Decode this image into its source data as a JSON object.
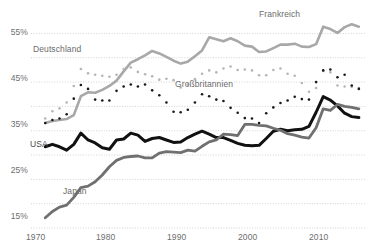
{
  "chart_data": {
    "type": "line",
    "title": "",
    "subtitle": "",
    "xlabel": "",
    "ylabel": "",
    "xlim": [
      1968,
      2015
    ],
    "ylim": [
      15,
      59
    ],
    "yticks": [
      15,
      25,
      35,
      45,
      55
    ],
    "ytick_labels": [
      "15%",
      "25%",
      "35%",
      "45%",
      "55%"
    ],
    "minor_gridlines": [
      20,
      30,
      40,
      50
    ],
    "xticks": [
      1970,
      1980,
      1990,
      2000,
      2010
    ],
    "xtick_labels": [
      "1970",
      "1980",
      "1990",
      "2000",
      "2010"
    ],
    "grid": "horizontal-dotted",
    "legend": "inline-annotations",
    "colors": {
      "frankreich": "#a8a8a8",
      "deutschland": "#b5b5b5",
      "grossbritannien": "#1a1a1a",
      "usa": "#111111",
      "japan": "#707070",
      "gridline": "#c8c8c8",
      "axis_text": "#6e6e6e",
      "background": "#ffffff"
    },
    "x": [
      1970,
      1971,
      1972,
      1973,
      1974,
      1975,
      1976,
      1977,
      1978,
      1979,
      1980,
      1981,
      1982,
      1983,
      1984,
      1985,
      1986,
      1987,
      1988,
      1989,
      1990,
      1991,
      1992,
      1993,
      1994,
      1995,
      1996,
      1997,
      1998,
      1999,
      2000,
      2001,
      2002,
      2003,
      2004,
      2005,
      2006,
      2007,
      2008,
      2009,
      2010,
      2011,
      2012,
      2013,
      2014
    ],
    "series": [
      {
        "name": "Frankreich",
        "style": "solid",
        "color": "#a8a8a8",
        "width": 2.6,
        "label_x": 1999,
        "label_y": 57.5,
        "values": [
          36.6,
          37.0,
          37.2,
          37.4,
          38.2,
          42.1,
          42.9,
          42.8,
          43.4,
          44.2,
          45.3,
          47.2,
          49.0,
          49.7,
          50.5,
          51.4,
          50.9,
          50.2,
          49.4,
          48.8,
          49.2,
          50.3,
          51.5,
          54.2,
          53.8,
          53.4,
          54.0,
          53.4,
          52.5,
          52.3,
          51.2,
          51.3,
          52.0,
          52.7,
          52.7,
          52.9,
          52.3,
          52.2,
          52.8,
          56.4,
          55.9,
          55.1,
          56.3,
          56.9,
          56.4
        ]
      },
      {
        "name": "Deutschland",
        "style": "dotted",
        "color": "#b5b5b5",
        "width": 2.6,
        "label_x": 1972,
        "label_y": 50.2,
        "values": [
          37.5,
          39.0,
          39.6,
          40.8,
          44.2,
          47.7,
          46.8,
          46.5,
          46.3,
          46.1,
          46.5,
          47.7,
          48.0,
          47.1,
          46.6,
          46.2,
          45.5,
          45.7,
          45.4,
          43.9,
          44.5,
          45.6,
          46.7,
          47.4,
          47.0,
          47.8,
          48.2,
          47.5,
          47.6,
          47.4,
          46.4,
          46.4,
          47.5,
          47.8,
          46.7,
          46.3,
          44.8,
          43.0,
          43.8,
          47.3,
          47.0,
          44.3,
          44.1,
          44.0,
          43.8
        ]
      },
      {
        "name": "Großbritannien",
        "style": "dotted",
        "color": "#1a1a1a",
        "width": 2.6,
        "label_x": 1989,
        "label_y": 42.8,
        "values": [
          36.6,
          37.2,
          37.5,
          38.4,
          41.6,
          44.4,
          43.6,
          41.4,
          41.2,
          41.2,
          43.2,
          44.1,
          44.5,
          44.1,
          44.5,
          43.3,
          42.3,
          40.8,
          38.9,
          38.8,
          39.3,
          40.8,
          42.5,
          42.1,
          41.4,
          41.1,
          39.7,
          38.7,
          37.6,
          37.5,
          36.6,
          38.6,
          39.8,
          40.7,
          41.2,
          42.0,
          41.5,
          41.4,
          45.0,
          47.4,
          47.6,
          46.0,
          46.5,
          44.3,
          43.6
        ]
      },
      {
        "name": "USA",
        "style": "solid",
        "color": "#111111",
        "width": 3.0,
        "label_x": 1970,
        "label_y": 34.0,
        "values": [
          31.7,
          32.2,
          31.7,
          31.0,
          32.2,
          34.5,
          33.1,
          32.5,
          31.5,
          31.2,
          33.1,
          33.3,
          34.5,
          34.1,
          32.8,
          33.4,
          33.6,
          33.1,
          32.6,
          32.7,
          33.6,
          34.3,
          34.9,
          34.3,
          33.6,
          33.6,
          33.0,
          32.4,
          32.0,
          31.9,
          32.0,
          33.4,
          34.9,
          35.3,
          35.0,
          35.2,
          35.3,
          35.9,
          38.8,
          42.0,
          41.3,
          40.1,
          38.6,
          37.9,
          37.7
        ]
      },
      {
        "name": "Japan",
        "style": "solid",
        "color": "#707070",
        "width": 2.8,
        "label_x": 1978,
        "label_y": 24.0,
        "values": [
          17.1,
          18.4,
          19.3,
          19.7,
          21.3,
          23.3,
          23.6,
          24.5,
          25.9,
          27.6,
          28.9,
          29.5,
          29.7,
          29.8,
          29.4,
          29.4,
          30.4,
          30.7,
          30.6,
          30.5,
          31.0,
          30.8,
          31.8,
          32.7,
          33.1,
          34.3,
          34.2,
          34.0,
          36.3,
          36.3,
          36.1,
          36.0,
          35.5,
          35.1,
          34.4,
          34.1,
          33.7,
          33.5,
          35.6,
          39.5,
          39.2,
          40.4,
          40.0,
          39.8,
          39.5
        ]
      }
    ]
  },
  "axis": {
    "y_labels": [
      "55%",
      "45%",
      "35%",
      "25%",
      "15%"
    ],
    "x_labels": [
      "1970",
      "1980",
      "1990",
      "2000",
      "2010"
    ]
  },
  "annotations": {
    "frankreich": "Frankreich",
    "deutschland": "Deutschland",
    "grossbritannien": "Großbritannien",
    "usa": "USA",
    "japan": "Japan"
  }
}
